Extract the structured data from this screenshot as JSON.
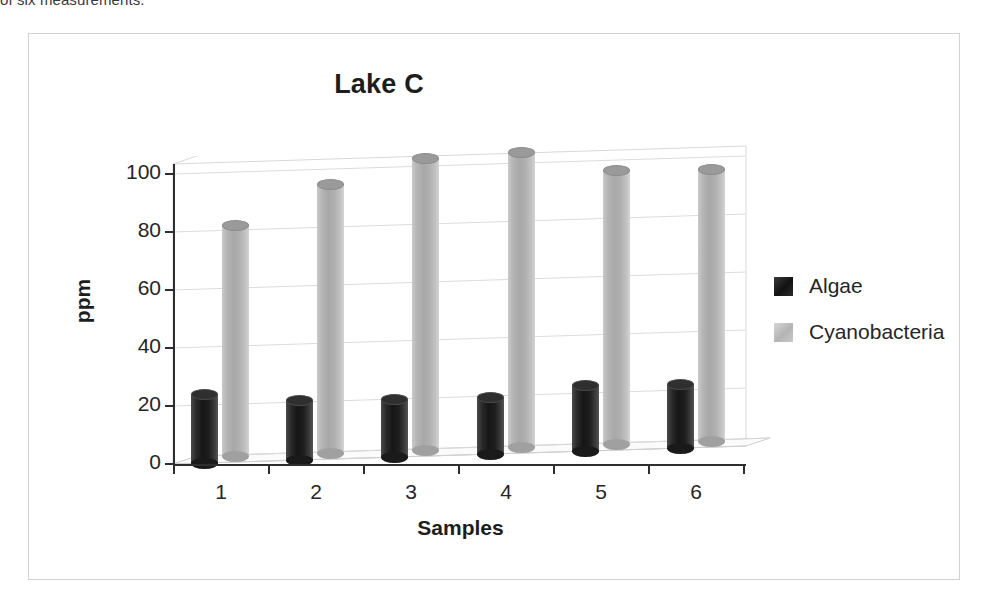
{
  "caption": {
    "text": "of six measurements."
  },
  "chart_data": {
    "type": "bar",
    "title": "Lake C",
    "xlabel": "Samples",
    "ylabel": "ppm",
    "categories": [
      "1",
      "2",
      "3",
      "4",
      "5",
      "6"
    ],
    "series": [
      {
        "name": "Algae",
        "color": "#1a1a1a",
        "values": [
          24,
          21,
          20.5,
          20,
          23,
          22.5
        ]
      },
      {
        "name": "Cyanobacteria",
        "color": "#b5b5b5",
        "values": [
          80,
          93,
          101,
          102,
          95,
          94
        ]
      }
    ],
    "ylim": [
      0,
      100
    ],
    "yticks": [
      0,
      20,
      40,
      60,
      80,
      100
    ],
    "ytick_labels": [
      "0",
      "20",
      "40",
      "60",
      "80",
      "100"
    ],
    "grid": true,
    "legend_position": "right",
    "style": "3d-cylinder"
  },
  "legend": {
    "entries": [
      {
        "label": "Algae"
      },
      {
        "label": "Cyanobacteria"
      }
    ]
  }
}
